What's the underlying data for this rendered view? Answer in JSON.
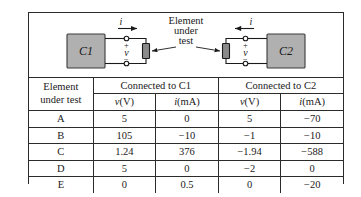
{
  "figure": {
    "diagram": {
      "element_label": [
        "Element",
        "under",
        "test"
      ],
      "blocks": [
        {
          "name": "C1",
          "label": "C1"
        },
        {
          "name": "C2",
          "label": "C2"
        }
      ],
      "current_symbol": "i",
      "voltage_symbol": "v",
      "plus_sign": "+",
      "minus_sign": "−",
      "colors": {
        "block_fill": "#b0b0b0",
        "element_fill": "#8a8a8a",
        "line": "#1a1a1a",
        "border": "#2b2b2b",
        "background": "#ffffff"
      }
    },
    "table": {
      "row_header": {
        "line1": "Element",
        "line2": "under test"
      },
      "groups": [
        {
          "label": "Connected to C1",
          "units": [
            "v(V)",
            "i(mA)"
          ]
        },
        {
          "label": "Connected to C2",
          "units": [
            "v(V)",
            "i(mA)"
          ]
        }
      ],
      "unit_v_symbol": "v",
      "unit_v_paren": "(V)",
      "unit_i_symbol": "i",
      "unit_i_paren": "(mA)",
      "rows": [
        {
          "element": "A",
          "c1_v": "5",
          "c1_i": "0",
          "c2_v": "5",
          "c2_i": "−70"
        },
        {
          "element": "B",
          "c1_v": "105",
          "c1_i": "−10",
          "c2_v": "−1",
          "c2_i": "−10"
        },
        {
          "element": "C",
          "c1_v": "1.24",
          "c1_i": "376",
          "c2_v": "−1.94",
          "c2_i": "−588"
        },
        {
          "element": "D",
          "c1_v": "5",
          "c1_i": "0",
          "c2_v": "−2",
          "c2_i": "0"
        },
        {
          "element": "E",
          "c1_v": "0",
          "c1_i": "0.5",
          "c2_v": "0",
          "c2_i": "−20"
        }
      ]
    }
  }
}
